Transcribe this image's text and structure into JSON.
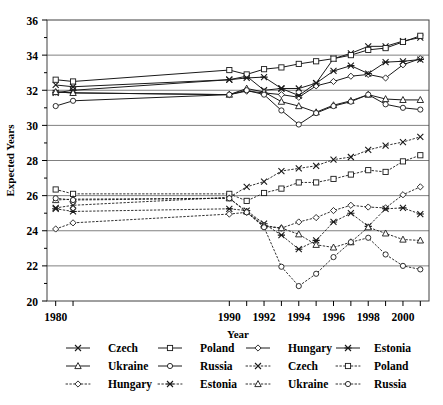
{
  "chart_data": {
    "type": "line",
    "title": "",
    "xlabel": "Year",
    "ylabel": "Expected Years",
    "xlim": [
      1979.5,
      2001.5
    ],
    "ylim": [
      20,
      36
    ],
    "yticks": [
      20,
      22,
      24,
      26,
      28,
      30,
      32,
      34,
      36
    ],
    "xticks": [
      1980,
      1981,
      1990,
      1991,
      1992,
      1993,
      1994,
      1995,
      1996,
      1997,
      1998,
      1999,
      2000,
      2001
    ],
    "xtick_labels": [
      "1980",
      "",
      "1990",
      "",
      "1992",
      "",
      "1994",
      "",
      "1996",
      "",
      "1998",
      "",
      "2000",
      ""
    ],
    "grid": "horizontal",
    "legend_position": "bottom",
    "x": [
      1980,
      1981,
      1990,
      1991,
      1992,
      1993,
      1994,
      1995,
      1996,
      1997,
      1998,
      1999,
      2000,
      2001
    ],
    "series": [
      {
        "name": "Czech",
        "group": "solid",
        "marker": "x",
        "dash": "solid",
        "values": [
          32.3,
          32.2,
          32.6,
          32.8,
          32.0,
          32.1,
          32.1,
          32.4,
          33.8,
          34.1,
          34.5,
          34.5,
          34.8,
          35.0
        ]
      },
      {
        "name": "Poland",
        "group": "solid",
        "marker": "square",
        "dash": "solid",
        "values": [
          32.6,
          32.5,
          33.15,
          32.9,
          33.2,
          33.3,
          33.5,
          33.65,
          33.8,
          34.0,
          34.3,
          34.4,
          34.75,
          35.1
        ]
      },
      {
        "name": "Hungary",
        "group": "solid",
        "marker": "diamond",
        "dash": "solid",
        "values": [
          31.9,
          31.85,
          31.75,
          31.95,
          31.85,
          31.75,
          31.6,
          32.25,
          32.5,
          32.8,
          32.9,
          32.7,
          33.45,
          33.8
        ]
      },
      {
        "name": "Estonia",
        "group": "solid",
        "marker": "star",
        "dash": "solid",
        "values": [
          31.85,
          32.0,
          32.6,
          32.7,
          32.75,
          32.1,
          31.7,
          32.4,
          33.1,
          33.4,
          32.95,
          33.6,
          33.65,
          33.75
        ]
      },
      {
        "name": "Ukraine",
        "group": "solid",
        "marker": "triangle",
        "dash": "solid",
        "values": [
          31.9,
          31.85,
          31.75,
          32.1,
          31.9,
          31.35,
          31.1,
          30.75,
          31.15,
          31.4,
          31.75,
          31.5,
          31.45,
          31.45
        ]
      },
      {
        "name": "Russia",
        "group": "solid",
        "marker": "circle",
        "dash": "solid",
        "values": [
          31.1,
          31.4,
          31.75,
          32.0,
          31.75,
          30.85,
          30.05,
          30.7,
          31.1,
          31.35,
          31.75,
          31.2,
          31.0,
          30.9
        ]
      },
      {
        "name": "Czech",
        "group": "dotted",
        "marker": "x",
        "dash": "dotted",
        "values": [
          25.3,
          25.45,
          25.9,
          26.5,
          26.8,
          27.4,
          27.55,
          27.7,
          28.05,
          28.2,
          28.6,
          28.85,
          29.05,
          29.35
        ]
      },
      {
        "name": "Poland",
        "group": "dotted",
        "marker": "square",
        "dash": "dotted",
        "values": [
          26.35,
          26.1,
          26.1,
          25.7,
          26.15,
          26.4,
          26.75,
          26.75,
          26.95,
          27.2,
          27.45,
          27.35,
          27.95,
          28.3
        ]
      },
      {
        "name": "Hungary",
        "group": "dotted",
        "marker": "diamond",
        "dash": "dotted",
        "values": [
          24.1,
          24.45,
          24.95,
          25.05,
          24.25,
          24.15,
          24.5,
          24.75,
          25.15,
          25.45,
          25.35,
          25.3,
          26.05,
          26.5
        ]
      },
      {
        "name": "Estonia",
        "group": "dotted",
        "marker": "star",
        "dash": "dotted",
        "values": [
          25.25,
          25.1,
          25.25,
          25.15,
          24.4,
          23.75,
          22.95,
          23.45,
          24.5,
          25.0,
          24.25,
          25.25,
          25.3,
          24.95
        ]
      },
      {
        "name": "Ukraine",
        "group": "dotted",
        "marker": "triangle",
        "dash": "dotted",
        "values": [
          25.75,
          25.8,
          25.85,
          25.1,
          24.3,
          24.15,
          23.8,
          23.2,
          23.05,
          23.35,
          24.2,
          23.85,
          23.5,
          23.45
        ]
      },
      {
        "name": "Russia",
        "group": "dotted",
        "marker": "circle",
        "dash": "dotted",
        "values": [
          25.85,
          25.75,
          25.85,
          25.05,
          24.2,
          21.95,
          20.85,
          21.55,
          22.5,
          23.35,
          23.6,
          22.65,
          22.0,
          21.8
        ]
      }
    ]
  },
  "legend": {
    "rows": [
      [
        {
          "label": "Czech",
          "marker": "x",
          "dash": "solid"
        },
        {
          "label": "Poland",
          "marker": "square",
          "dash": "solid"
        },
        {
          "label": "Hungary",
          "marker": "diamond",
          "dash": "solid"
        },
        {
          "label": "Estonia",
          "marker": "star",
          "dash": "solid"
        }
      ],
      [
        {
          "label": "Ukraine",
          "marker": "triangle",
          "dash": "solid"
        },
        {
          "label": "Russia",
          "marker": "circle",
          "dash": "solid"
        },
        {
          "label": "Czech",
          "marker": "x",
          "dash": "dotted"
        },
        {
          "label": "Poland",
          "marker": "square",
          "dash": "dotted"
        }
      ],
      [
        {
          "label": "Hungary",
          "marker": "diamond",
          "dash": "dotted"
        },
        {
          "label": "Estonia",
          "marker": "star",
          "dash": "dotted"
        },
        {
          "label": "Ukraine",
          "marker": "triangle",
          "dash": "dotted"
        },
        {
          "label": "Russia",
          "marker": "circle",
          "dash": "dotted"
        }
      ]
    ]
  },
  "colors": {
    "line": "#1a1a1a",
    "grid": "#808080",
    "axis": "#404040",
    "background": "#ffffff"
  }
}
